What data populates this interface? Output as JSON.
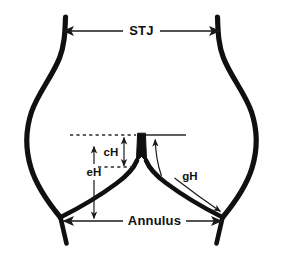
{
  "figure": {
    "background_color": "#ffffff",
    "stroke_color": "#101010",
    "width": 283,
    "height": 259
  },
  "labels": {
    "stj": "STJ",
    "annulus": "Annulus",
    "ch": "cH",
    "eh": "eH",
    "gh": "gH"
  },
  "annotations": [
    {
      "name": "stj",
      "label": "STJ",
      "kind": "double-arrow-horizontal",
      "description": "Sinotubular junction width, measured between the left and right aortic wall at the top of the sinuses",
      "x1": 62,
      "x2": 220,
      "y": 31
    },
    {
      "name": "annulus",
      "label": "Annulus",
      "kind": "double-arrow-horizontal",
      "description": "Annulus diameter, measured between the left and right leaflet basal attachment points",
      "x1": 62,
      "x2": 222,
      "y": 221
    },
    {
      "name": "ch",
      "label": "cH",
      "kind": "double-arrow-vertical",
      "description": "Coaptation height, measured between the free edge reference line and the coaptation point",
      "x": 124,
      "y1": 136,
      "y2": 167
    },
    {
      "name": "eh",
      "label": "eH",
      "kind": "double-arrow-vertical",
      "description": "Effective height, measured from the annular plane to the leaflet free edge centre",
      "x": 94,
      "y1": 136,
      "y2": 220
    },
    {
      "name": "gh",
      "label": "gH",
      "kind": "double-arrow-curved",
      "description": "Geometric height, measured along the leaflet from the commissure top to the basal attachment",
      "x1": 155,
      "y1": 136,
      "x2": 222,
      "y2": 213
    }
  ],
  "reference_lines": [
    {
      "name": "free-edge-reference-line",
      "style": "dashed-left-solid-right",
      "y": 135,
      "x_start": 70,
      "x_end": 185
    },
    {
      "name": "coaptation-reference-line",
      "style": "dashed",
      "y": 167,
      "x_start": 98,
      "x_end": 130
    }
  ],
  "structures": [
    {
      "name": "left-aortic-wall",
      "description": "Left sinus of Valsalva outer wall"
    },
    {
      "name": "right-aortic-wall",
      "description": "Right sinus of Valsalva outer wall"
    },
    {
      "name": "left-leaflet",
      "description": "Left aortic valve leaflet in closed position"
    },
    {
      "name": "right-leaflet",
      "description": "Right aortic valve leaflet in closed position"
    },
    {
      "name": "coaptation-column",
      "description": "Central coaptation/commissure column where the leaflets meet"
    }
  ]
}
